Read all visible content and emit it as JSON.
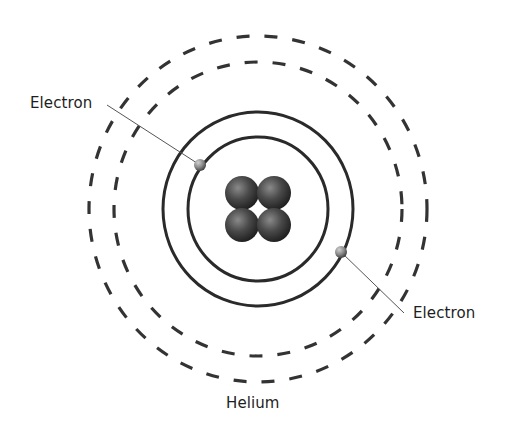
{
  "diagram": {
    "title": "Helium",
    "labels": {
      "electron_left": "Electron",
      "electron_right": "Electron",
      "caption": "Helium"
    },
    "colors": {
      "background": "#ffffff",
      "orbit_stroke": "#2a2a2a",
      "dashed_stroke": "#333333",
      "leader_line": "#555555",
      "text": "#1e1e1e",
      "nucleus_dark": "#1a1a1a",
      "nucleus_light": "#8a8a8a",
      "electron_light": "#b5b5b5",
      "electron_dark": "#2e2e2e"
    },
    "center": {
      "x": 258,
      "y": 209
    },
    "orbits": [
      {
        "name": "inner-solid-orbit",
        "style": "solid",
        "rx": 70,
        "ry": 72
      },
      {
        "name": "outer-solid-orbit",
        "style": "solid",
        "rx": 95,
        "ry": 97
      },
      {
        "name": "inner-dashed-shell",
        "style": "dashed",
        "rx": 144,
        "ry": 147
      },
      {
        "name": "outer-dashed-shell",
        "style": "dashed",
        "rx": 169,
        "ry": 173
      }
    ],
    "nucleus": {
      "particles": 4,
      "description": "2 protons + 2 neutrons",
      "positions": [
        {
          "x": 242,
          "y": 193
        },
        {
          "x": 274,
          "y": 193
        },
        {
          "x": 242,
          "y": 225
        },
        {
          "x": 274,
          "y": 225
        }
      ],
      "particle_radius": 17
    },
    "electrons": [
      {
        "name": "electron-upper-left",
        "x": 200,
        "y": 165,
        "r": 6,
        "leader_to": {
          "x": 107,
          "y": 105
        }
      },
      {
        "name": "electron-lower-right",
        "x": 341,
        "y": 252,
        "r": 6,
        "leader_to": {
          "x": 404,
          "y": 313
        }
      }
    ]
  }
}
